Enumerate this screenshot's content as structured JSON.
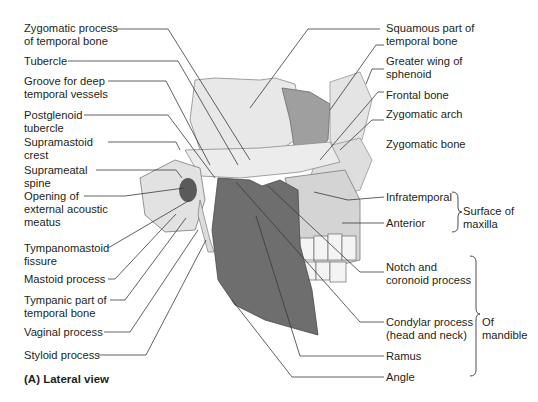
{
  "figure": {
    "caption": "(A) Lateral view",
    "colors": {
      "bone_light": "#e6e6e6",
      "bone_mid": "#cfcfcf",
      "sphenoid": "#9c9c9c",
      "mandible": "#6f6f6f",
      "line": "#3a3a3a",
      "text": "#231f20"
    }
  },
  "labels_left": [
    {
      "text": "Zygomatic process\nof temporal bone"
    },
    {
      "text": "Tubercle"
    },
    {
      "text": "Groove for deep\ntemporal vessels"
    },
    {
      "text": "Postglenoid\ntubercle"
    },
    {
      "text": "Supramastoid\ncrest"
    },
    {
      "text": "Suprameatal\nspine"
    },
    {
      "text": "Opening of\nexternal acoustic\nmeatus"
    },
    {
      "text": "Tympanomastoid\nfissure"
    },
    {
      "text": "Mastoid process"
    },
    {
      "text": "Tympanic part of\ntemporal bone"
    },
    {
      "text": "Vaginal process"
    },
    {
      "text": "Styloid process"
    }
  ],
  "labels_right": [
    {
      "text": "Squamous part of\ntemporal bone"
    },
    {
      "text": "Greater wing of\nsphenoid"
    },
    {
      "text": "Frontal bone"
    },
    {
      "text": "Zygomatic arch"
    },
    {
      "text": "Zygomatic bone"
    },
    {
      "text": "Infratemporal"
    },
    {
      "text": "Anterior"
    },
    {
      "text": "Notch and\ncoronoid process"
    },
    {
      "text": "Condylar process\n(head and neck)"
    },
    {
      "text": "Ramus"
    },
    {
      "text": "Angle"
    }
  ],
  "groups": [
    {
      "text": "Surface of\nmaxilla"
    },
    {
      "text": "Of\nmandible"
    }
  ]
}
